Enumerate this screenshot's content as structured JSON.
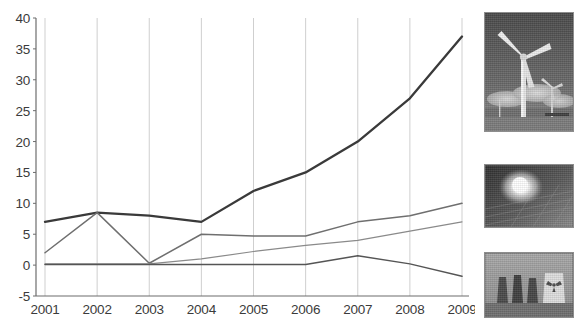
{
  "chart_data": {
    "type": "line",
    "title": "",
    "subtitle": "",
    "xlabel": "",
    "ylabel": "",
    "categories": [
      "2001",
      "2002",
      "2003",
      "2004",
      "2005",
      "2006",
      "2007",
      "2008",
      "2009"
    ],
    "x_tick_labels": [
      "2001",
      "2002",
      "2003",
      "2004",
      "2005",
      "2006",
      "2007",
      "2008",
      "2009"
    ],
    "y_tick_labels": [
      "40",
      "35",
      "30",
      "25",
      "20",
      "15",
      "10",
      "5",
      "0",
      "-5"
    ],
    "y_ticks": [
      40,
      35,
      30,
      25,
      20,
      15,
      10,
      5,
      0,
      -5
    ],
    "ylim": [
      -5,
      40
    ],
    "grid": true,
    "grid_axis": "x",
    "legend": "none",
    "legend_position": "none",
    "annotations": [],
    "series": [
      {
        "name": "series-1",
        "color": "#3a3a3a",
        "values": [
          7.0,
          8.5,
          8.0,
          7.0,
          12.0,
          15.0,
          20.0,
          27.0,
          37.0
        ]
      },
      {
        "name": "series-2",
        "color": "#6f6f6f",
        "values": [
          2.0,
          8.5,
          0.3,
          5.0,
          4.7,
          4.7,
          7.0,
          8.0,
          10.0
        ]
      },
      {
        "name": "series-3",
        "color": "#8a8a8a",
        "values": [
          0.2,
          0.2,
          0.2,
          1.0,
          2.2,
          3.2,
          4.0,
          5.5,
          7.0
        ]
      },
      {
        "name": "series-4",
        "color": "#555555",
        "values": [
          0.1,
          0.1,
          0.1,
          0.1,
          0.1,
          0.1,
          1.5,
          0.2,
          -1.8
        ]
      }
    ]
  },
  "photos": [
    {
      "name": "wind-turbine-photo",
      "caption": ""
    },
    {
      "name": "solar-panel-photo",
      "caption": ""
    },
    {
      "name": "cooling-towers-photo",
      "caption": ""
    }
  ],
  "colors": {
    "axis": "#6d6d6d",
    "grid": "#c9c9c9",
    "text": "#3b3b3b",
    "background": "#ffffff"
  }
}
